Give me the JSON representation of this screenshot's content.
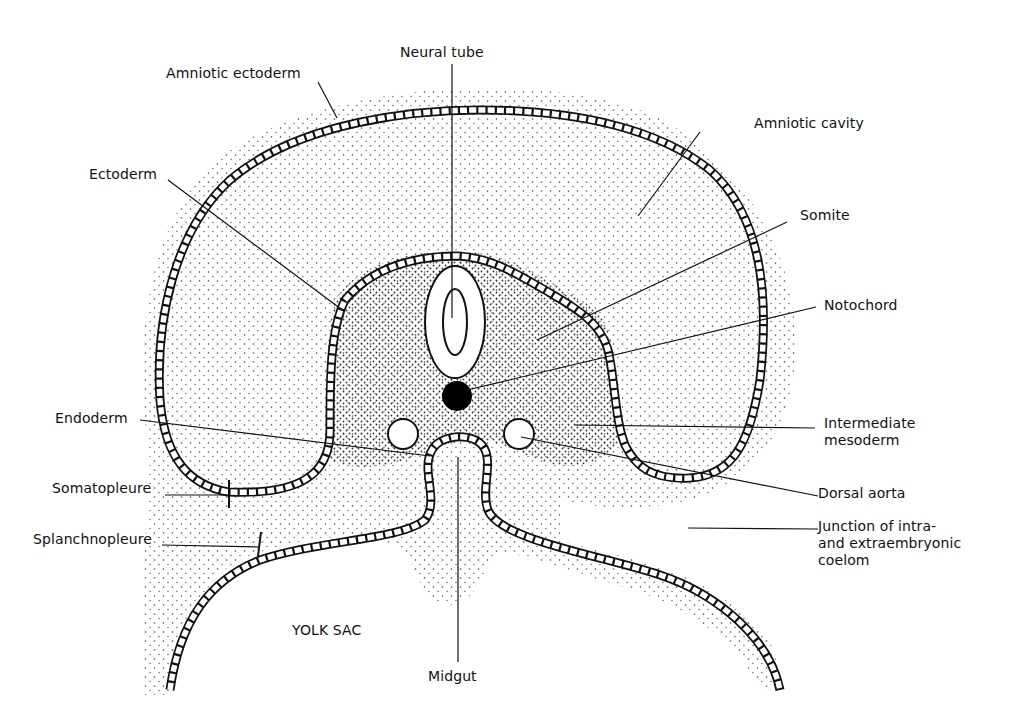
{
  "figure": {
    "labels": {
      "neural_tube": "Neural tube",
      "amniotic_ectoderm": "Amniotic ectoderm",
      "amniotic_cavity": "Amniotic cavity",
      "ectoderm": "Ectoderm",
      "somite": "Somite",
      "notochord": "Notochord",
      "endoderm": "Endoderm",
      "intermediate_mesoderm": "Intermediate\nmesoderm",
      "somatopleure": "Somatopleure",
      "dorsal_aorta": "Dorsal aorta",
      "splanchnopleure": "Splanchnopleure",
      "junction_coelom": "Junction of intra-\nand extraembryonic\ncoelom",
      "yolk_sac": "YOLK SAC",
      "midgut": "Midgut"
    },
    "colors": {
      "ink": "#111111",
      "background": "#ffffff",
      "stipple": "#444444"
    }
  }
}
